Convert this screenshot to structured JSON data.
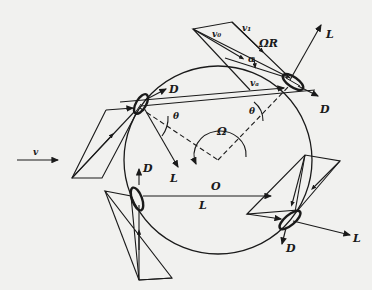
{
  "diagram": {
    "labels": {
      "freestream_velocity": "v",
      "center": "O",
      "rotation": "Ω",
      "tip_speed": "ΩR",
      "relative_velocity": "v₁",
      "induced_velocity": "v₀",
      "axial_velocity": "vₐ",
      "angle_of_attack": "α",
      "azimuth_angle_1": "θ",
      "azimuth_angle_2": "θ",
      "lift_top_left": "L",
      "drag_top_left": "D",
      "lift_top_right": "L",
      "drag_top_right": "D",
      "lift_left": "L",
      "drag_left": "D",
      "lift_bottom_right": "L",
      "drag_bottom_right": "D"
    },
    "colors": {
      "ink": "#1a1a1a",
      "background": "#f1f1ef"
    }
  }
}
